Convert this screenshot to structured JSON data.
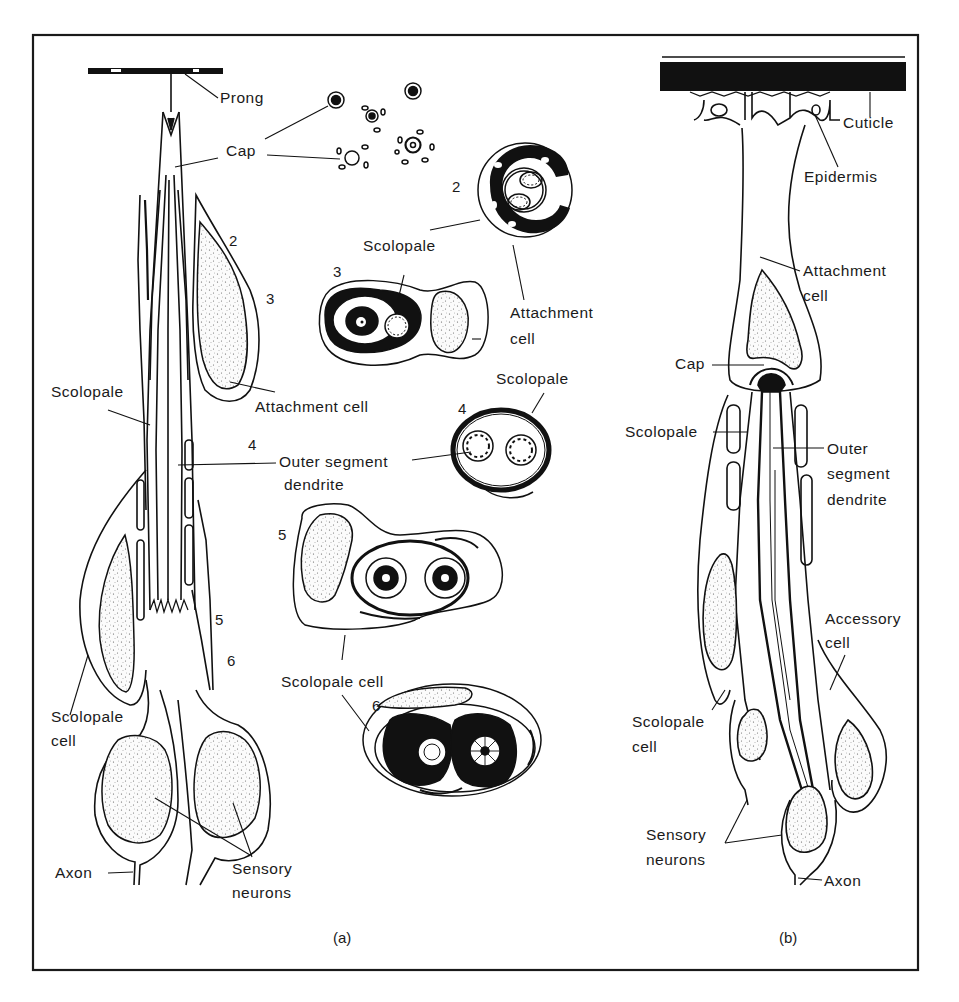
{
  "figure": {
    "type": "anatomical diagram",
    "border_color": "#1a1a1a",
    "ink_color": "#111111",
    "nucleus_fill": "#f4f4f4"
  },
  "panel_a": {
    "caption": "(a)",
    "labels": {
      "prong": "Prong",
      "cap": "Cap",
      "scolopale": "Scolopale",
      "attachment_cell": "Attachment cell",
      "outer_segment_dendrite_line1": "Outer segment",
      "outer_segment_dendrite_line2": "dendrite",
      "scolopale_cell_line1": "Scolopale",
      "scolopale_cell_line2": "cell",
      "axon": "Axon",
      "sensory_neurons_line1": "Sensory",
      "sensory_neurons_line2": "neurons"
    },
    "level_markers": [
      "2",
      "3",
      "4",
      "5",
      "6"
    ]
  },
  "cross_sections": {
    "labels": {
      "scolopale_2": "Scolopale",
      "attachment_cell_line1": "Attachment",
      "attachment_cell_line2": "cell",
      "scolopale_4": "Scolopale",
      "scolopale_cell": "Scolopale cell"
    },
    "section_numbers": [
      "2",
      "3",
      "4",
      "5",
      "6"
    ]
  },
  "panel_b": {
    "caption": "(b)",
    "labels": {
      "cuticle": "Cuticle",
      "epidermis": "Epidermis",
      "attachment_cell_line1": "Attachment",
      "attachment_cell_line2": "cell",
      "cap": "Cap",
      "scolopale": "Scolopale",
      "outer_segment_line1": "Outer",
      "outer_segment_line2": "segment",
      "outer_segment_line3": "dendrite",
      "accessory_cell_line1": "Accessory",
      "accessory_cell_line2": "cell",
      "scolopale_cell_line1": "Scolopale",
      "scolopale_cell_line2": "cell",
      "sensory_neurons_line1": "Sensory",
      "sensory_neurons_line2": "neurons",
      "axon": "Axon"
    }
  }
}
